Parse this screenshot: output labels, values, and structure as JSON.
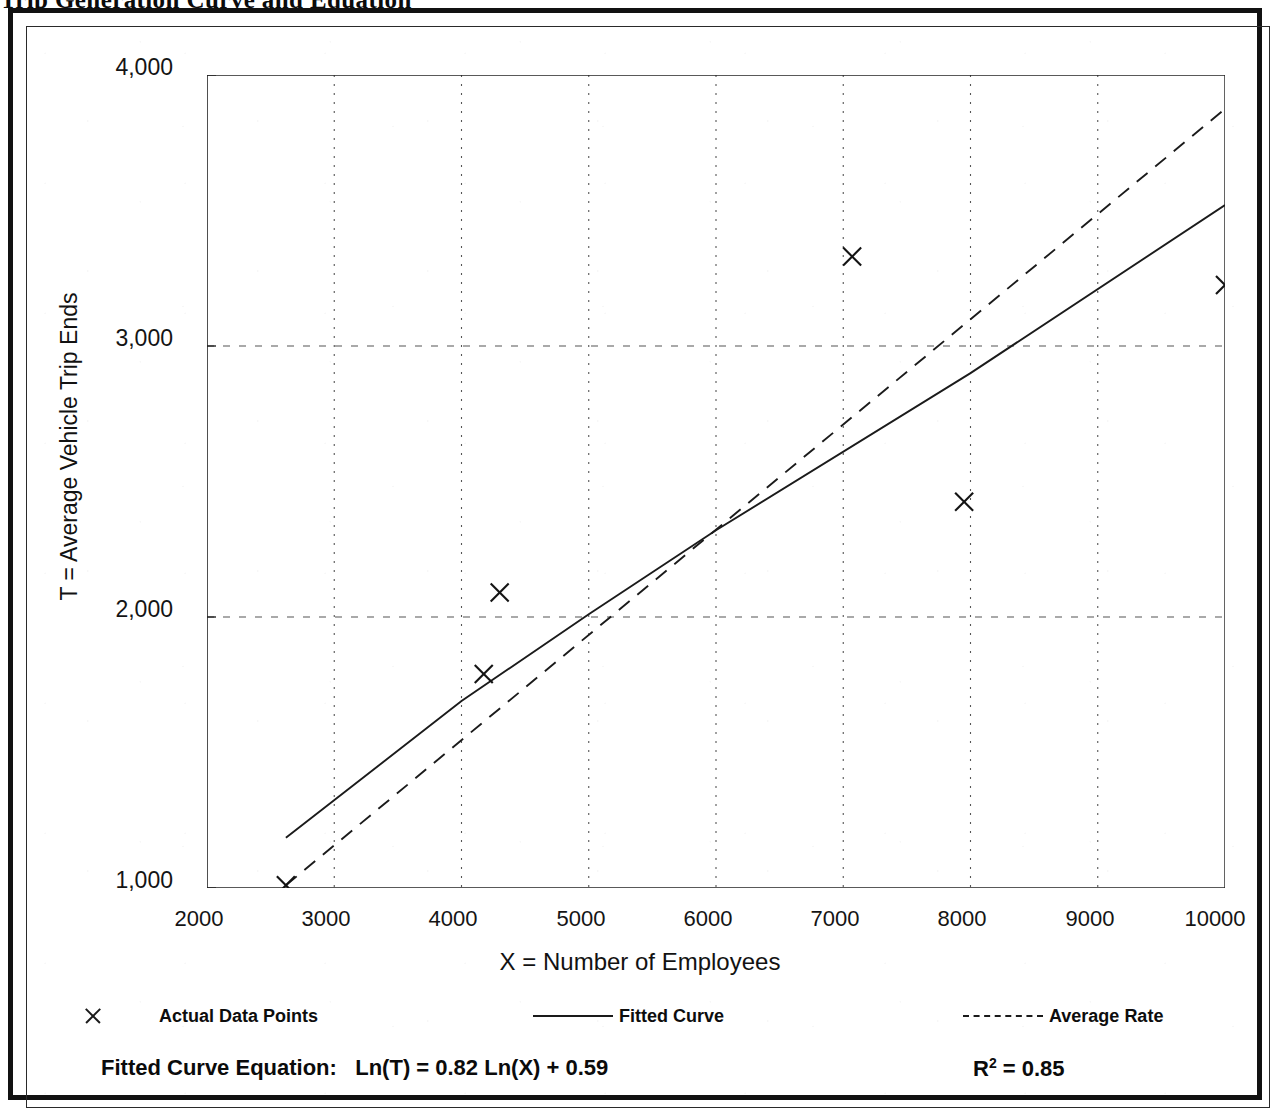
{
  "document": {
    "title_fragment": "Trip Generation Curve and Equation"
  },
  "chart_data": {
    "type": "scatter",
    "title": "",
    "xlabel": "X = Number of Employees",
    "ylabel": "T = Average Vehicle Trip Ends",
    "xlim": [
      2000,
      10000
    ],
    "ylim": [
      1000,
      4000
    ],
    "xticks": [
      "2000",
      "3000",
      "4000",
      "5000",
      "6000",
      "7000",
      "8000",
      "9000",
      "10000"
    ],
    "yticks": [
      "1,000",
      "2,000",
      "3,000",
      "4,000"
    ],
    "y_minor_ticks": [
      1500,
      2500,
      3500
    ],
    "grid": "dotted vertical at each 1000; dashed horizontal at 2,000 and 3,000",
    "legend_position": "below plot",
    "series": [
      {
        "name": "Actual Data Points",
        "type": "scatter",
        "marker": "x",
        "points": [
          {
            "x": 2620,
            "y": 1010
          },
          {
            "x": 4175,
            "y": 1790
          },
          {
            "x": 4300,
            "y": 2090
          },
          {
            "x": 7070,
            "y": 3330
          },
          {
            "x": 7950,
            "y": 2425
          },
          {
            "x": 10000,
            "y": 3225
          }
        ]
      },
      {
        "name": "Fitted Curve",
        "type": "line",
        "style": "solid",
        "points": [
          {
            "x": 2620,
            "y": 1185
          },
          {
            "x": 4000,
            "y": 1690
          },
          {
            "x": 5000,
            "y": 2010
          },
          {
            "x": 6000,
            "y": 2320
          },
          {
            "x": 8000,
            "y": 2900
          },
          {
            "x": 10000,
            "y": 3520
          }
        ]
      },
      {
        "name": "Average Rate",
        "type": "line",
        "style": "dashed",
        "points": [
          {
            "x": 2620,
            "y": 1010
          },
          {
            "x": 10000,
            "y": 3875
          }
        ]
      }
    ],
    "annotations": {
      "equation_label": "Fitted Curve Equation:",
      "equation": "Ln(T) = 0.82 Ln(X) + 0.59",
      "r_squared_symbol": "R",
      "r_squared_exponent": "2",
      "r_squared_value": "= 0.85"
    }
  },
  "legend": {
    "items": [
      {
        "label": "Actual Data Points",
        "key": "x-marker-icon"
      },
      {
        "label": "Fitted Curve",
        "key": "solid-line-icon"
      },
      {
        "label": "Average Rate",
        "key": "dashed-line-icon"
      }
    ]
  },
  "colors": {
    "ink": "#111111",
    "grid": "#555555",
    "paper": "#ffffff"
  }
}
